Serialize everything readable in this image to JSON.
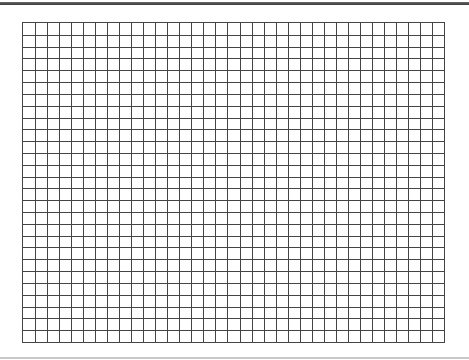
{
  "grid": {
    "columns": 35,
    "rows": 27,
    "line_color": "#444444",
    "background": "#ffffff"
  },
  "chrome": {
    "top_bar_color": "#4a4a4a",
    "bottom_bar_color": "#c8c8c8"
  }
}
